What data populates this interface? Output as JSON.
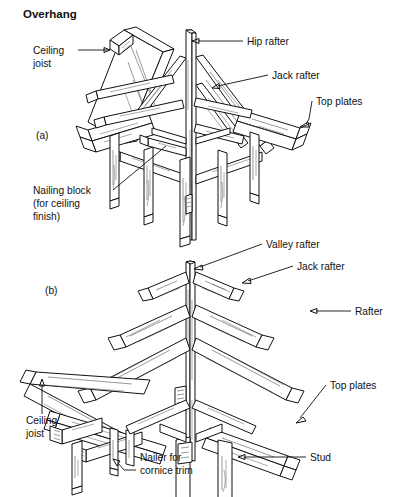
{
  "figure": {
    "title": "Overhang",
    "panels": [
      {
        "id": "panel-a",
        "marker": "(a)"
      },
      {
        "id": "panel-b",
        "marker": "(b)"
      }
    ],
    "labels_panel_a": [
      {
        "name": "ceiling-joist",
        "text_line1": "Ceiling",
        "text_line2": "joist"
      },
      {
        "name": "hip-rafter",
        "text_line1": "Hip rafter"
      },
      {
        "name": "jack-rafter",
        "text_line1": "Jack rafter"
      },
      {
        "name": "top-plates",
        "text_line1": "Top plates"
      },
      {
        "name": "nailing-block",
        "text_line1": "Nailing block",
        "text_line2": "(for ceiling",
        "text_line3": "finish)"
      }
    ],
    "labels_panel_b": [
      {
        "name": "valley-rafter",
        "text_line1": "Valley rafter"
      },
      {
        "name": "jack-rafter",
        "text_line1": "Jack rafter"
      },
      {
        "name": "rafter",
        "text_line1": "Rafter"
      },
      {
        "name": "top-plates",
        "text_line1": "Top plates"
      },
      {
        "name": "ceiling-joist",
        "text_line1": "Ceiling",
        "text_line2": "joist"
      },
      {
        "name": "nailer-cornice",
        "text_line1": "Nailer for",
        "text_line2": "cornice trim"
      },
      {
        "name": "stud",
        "text_line1": "Stud"
      }
    ],
    "colors": {
      "background": "#ffffff",
      "ink": "#111111",
      "grain": "#4a4a4a"
    }
  }
}
